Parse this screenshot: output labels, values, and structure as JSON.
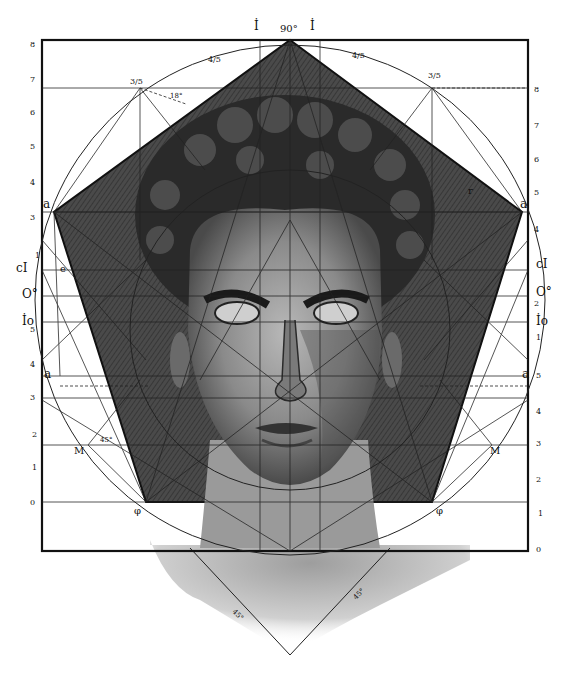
{
  "colors": {
    "ink": "#111111",
    "paper": "#ffffff",
    "shade_dark": "#3a3a3a",
    "shade_mid": "#6a6a6a",
    "face_light": "#a8a8a8"
  },
  "top_labels": {
    "left_I": "İ",
    "right_I": "İ",
    "apex_angle": "90°"
  },
  "fractions": {
    "upper_left": "3/5",
    "upper_right": "3/5",
    "top_left_small": "4/5",
    "top_right_small": "4/5",
    "angle_18": "18°"
  },
  "left_scale": [
    "8",
    "7",
    "6",
    "5",
    "4",
    "3",
    "1",
    "5",
    "4",
    "3",
    "2",
    "1",
    "0"
  ],
  "right_scale": [
    "8",
    "7",
    "6",
    "5",
    "4",
    "2",
    "1",
    "5",
    "4",
    "3",
    "2",
    "1",
    "0"
  ],
  "left_points": {
    "a_upper": "a",
    "cI": "cI",
    "e": "e",
    "O": "O°",
    "Io": "İo",
    "a_lower": "a",
    "M": "M",
    "phi": "φ",
    "angle_45": "45°"
  },
  "right_points": {
    "a_upper": "a",
    "r": "r",
    "cI": "cI",
    "O": "O°",
    "Io": "İo",
    "a_lower": "a",
    "M": "M",
    "phi": "φ"
  },
  "neck_angles": {
    "left": "45°",
    "right": "45°"
  }
}
